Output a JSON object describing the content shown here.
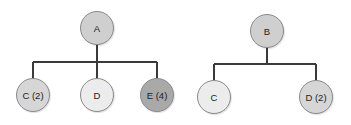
{
  "diagram": {
    "type": "tree",
    "trees": [
      {
        "root": {
          "label": "A",
          "fill": "#cfcfcf"
        },
        "children": [
          {
            "label": "C (2)",
            "fill": "#d6d6d6"
          },
          {
            "label": "D",
            "fill": "#ececec"
          },
          {
            "label": "E (4)",
            "fill": "#a9a9a9"
          }
        ]
      },
      {
        "root": {
          "label": "B",
          "fill": "#cfcfcf"
        },
        "children": [
          {
            "label": "C",
            "fill": "#ececec"
          },
          {
            "label": "D (2)",
            "fill": "#d6d6d6"
          }
        ]
      }
    ],
    "line_color": "#3a3a3a"
  }
}
